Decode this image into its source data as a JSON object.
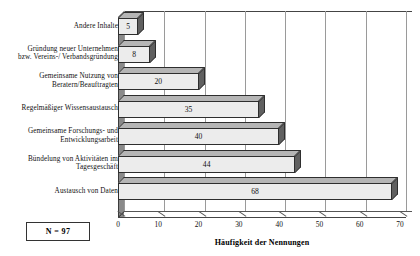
{
  "chart_data": {
    "type": "bar",
    "orientation": "horizontal",
    "title": "",
    "xlabel": "Häufigkeit der Nennungen",
    "ylabel": "",
    "xlim": [
      0,
      70
    ],
    "xticks": [
      0,
      10,
      20,
      30,
      40,
      50,
      60,
      70
    ],
    "grid": true,
    "legend": false,
    "style_3d": true,
    "categories": [
      "Andere Inhalte",
      "Gründung neuer Unternehmen\nbzw. Vereins-/ Verbandsgründung",
      "Gemeinsame Nutzung von\nBeratern/Beauftragten",
      "Regelmäßiger Wissensaustausch",
      "Gemeinsame Forschungs- und\nEntwicklungsarbeit",
      "Bündelung von Aktivitäten im\nTagesgeschäft",
      "Austausch von Daten"
    ],
    "values": [
      5,
      8,
      20,
      35,
      40,
      44,
      68
    ],
    "value_labels": [
      "5",
      "8",
      "20",
      "35",
      "40",
      "44",
      "68"
    ],
    "annotations": [
      {
        "name": "sample-size",
        "text": "N = 97"
      }
    ]
  },
  "axis": {
    "tick_labels": [
      "0",
      "10",
      "20",
      "30",
      "40",
      "50",
      "60",
      "70"
    ],
    "title": "Häufigkeit der Nennungen"
  },
  "sample_size_box": {
    "label": "N = 97"
  },
  "colors": {
    "bar_face": "#ececec",
    "bar_top": "#b5b5b5",
    "bar_side": "#606060",
    "bar_outline": "#2e2e2e",
    "gridline": "#9a9a9a",
    "axis": "#444444",
    "wall": "#8a8a8a",
    "text": "#111111",
    "background": "#ffffff"
  }
}
